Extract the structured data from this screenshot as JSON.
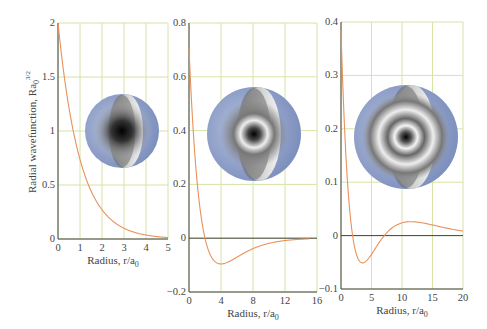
{
  "ylabel_main": "Radial wavefunction, Ra",
  "ylabel_sub": "0",
  "ylabel_sup": "3/2",
  "xlabel_main": "Radius, r/a",
  "xlabel_sub": "0",
  "colors": {
    "curve": "#e8915a",
    "grid": "#d6e4a6",
    "axis": "#444444",
    "sphere_outer": "#8a9cc6"
  },
  "chart_data": [
    {
      "type": "line",
      "title": "1s",
      "xlabel": "Radius, r/a0",
      "ylabel": "Radial wavefunction, Ra0^3/2",
      "xlim": [
        0,
        5
      ],
      "ylim": [
        0,
        2
      ],
      "xticks": [
        "0",
        "1",
        "2",
        "3",
        "4",
        "5"
      ],
      "yticks": [
        "0",
        "0.5",
        "1",
        "1.5",
        "2"
      ],
      "grid": true,
      "x": [
        0,
        0.5,
        1,
        1.5,
        2,
        2.5,
        3,
        3.5,
        4,
        4.5,
        5
      ],
      "values": [
        2.0,
        1.21,
        0.74,
        0.45,
        0.27,
        0.16,
        0.1,
        0.06,
        0.04,
        0.02,
        0.01
      ]
    },
    {
      "type": "line",
      "title": "2s",
      "xlabel": "Radius, r/a0",
      "xlim": [
        0,
        16
      ],
      "ylim": [
        -0.2,
        0.8
      ],
      "xticks": [
        "0",
        "4",
        "8",
        "12",
        "16"
      ],
      "yticks": [
        "-0.2",
        "0",
        "0.2",
        "0.4",
        "0.6",
        "0.8"
      ],
      "grid": true,
      "x": [
        0,
        1,
        2,
        3,
        4,
        6,
        8,
        10,
        12,
        15
      ],
      "values": [
        0.71,
        0.21,
        0.0,
        -0.08,
        -0.1,
        -0.07,
        -0.04,
        -0.02,
        -0.009,
        -0.002
      ]
    },
    {
      "type": "line",
      "title": "3s",
      "xlabel": "Radius, r/a0",
      "xlim": [
        0,
        20
      ],
      "ylim": [
        -0.1,
        0.4
      ],
      "xticks": [
        "0",
        "5",
        "10",
        "15",
        "20"
      ],
      "yticks": [
        "-0.1",
        "0",
        "0.1",
        "0.2",
        "0.3",
        "0.4"
      ],
      "grid": true,
      "x": [
        0,
        1,
        2,
        3,
        4,
        5,
        7,
        9,
        11,
        13,
        15,
        20
      ],
      "values": [
        0.385,
        0.21,
        0.07,
        -0.02,
        -0.05,
        -0.05,
        -0.01,
        0.02,
        0.03,
        0.03,
        0.026,
        0.013
      ]
    }
  ]
}
